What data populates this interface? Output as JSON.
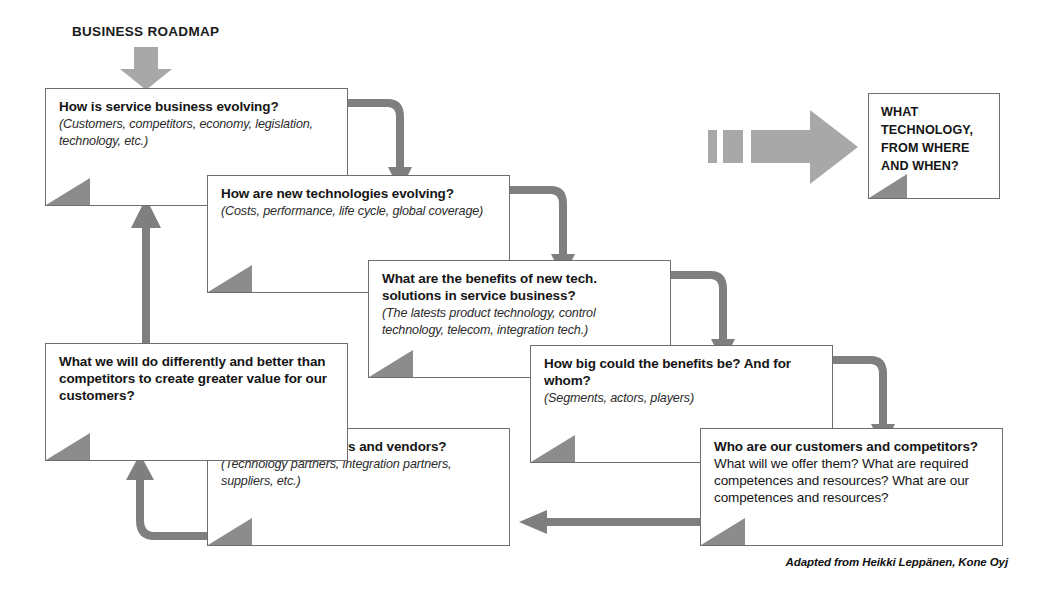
{
  "header": {
    "title": "BUSINESS ROADMAP",
    "arrow_icon": "down-arrow-icon"
  },
  "flow": {
    "boxes": [
      {
        "id": "service-business",
        "heading": "How is service business evolving?",
        "sub": "(Customers, competitors, economy, legislation, technology, etc.)"
      },
      {
        "id": "new-technologies",
        "heading": "How are new technologies evolving?",
        "sub": "(Costs, performance, life cycle, global coverage)"
      },
      {
        "id": "benefits-new-tech",
        "heading": "What are the benefits of new tech. solutions in service business?",
        "sub": "(The latests product technology, control technology, telecom, integration tech.)"
      },
      {
        "id": "how-big-benefits",
        "heading": "How big could the benefits be? And for whom?",
        "sub": "(Segments, actors, players)"
      },
      {
        "id": "customers-competitors",
        "heading": "Who are our customers and competitors?",
        "sub": "",
        "trailing": " What will we offer them? What are required competences and resources? What are our competences and resources?"
      },
      {
        "id": "partners-vendors",
        "heading": "Who are our partners and vendors?",
        "sub": "(Technology partners, integration partners, suppliers, etc.)"
      },
      {
        "id": "differentiation",
        "heading": "What we will do differently and better than competitors to create greater value for our customers?",
        "sub": ""
      }
    ]
  },
  "outcome": {
    "id": "what-technology",
    "line1": "WHAT",
    "line2": "TECHNOLOGY,",
    "line3": "FROM WHERE",
    "line4": "AND WHEN?",
    "arrow_icon": "segmented-right-arrow-icon"
  },
  "credit": {
    "text": "Adapted from Heikki Leppänen, Kone Oyj"
  },
  "colors": {
    "arrow_gray": "#7f7f7f",
    "big_arrow_gray": "#a8a8a8",
    "corner_gray": "#8c8c8c",
    "border_gray": "#6e6e6e",
    "text": "#151515"
  }
}
